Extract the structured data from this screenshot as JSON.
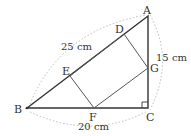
{
  "diagram": {
    "type": "geometry",
    "points": {
      "A": {
        "label": "A",
        "x": 148,
        "y": 16
      },
      "B": {
        "label": "B",
        "x": 27,
        "y": 108
      },
      "C": {
        "label": "C",
        "x": 148,
        "y": 108
      },
      "D": {
        "label": "D",
        "x": 124,
        "y": 34
      },
      "E": {
        "label": "E",
        "x": 70,
        "y": 76
      },
      "F": {
        "label": "F",
        "x": 94,
        "y": 108
      },
      "G": {
        "label": "G",
        "x": 148,
        "y": 68
      }
    },
    "measurements": {
      "AB": "25 cm",
      "AC": "15 cm",
      "BC": "20 cm"
    },
    "colors": {
      "lines": "#333333",
      "dotted_arcs": "#bbbbbb"
    }
  }
}
